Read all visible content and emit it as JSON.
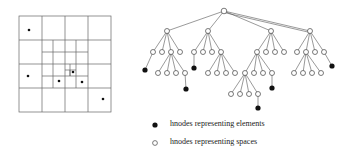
{
  "legend": {
    "filled_label": "hnodes representing elements",
    "hollow_label": "hnodes representing spaces"
  },
  "colors": {
    "line": "#555555",
    "fill": "#111111",
    "bg": "#ffffff"
  }
}
